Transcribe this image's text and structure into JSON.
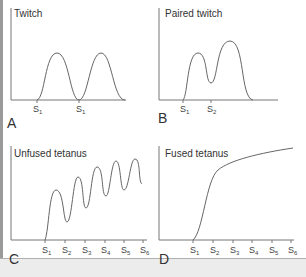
{
  "figure": {
    "panels": [
      {
        "id": "A",
        "title": "Twitch",
        "stimuli": [
          "S1",
          "S1"
        ]
      },
      {
        "id": "B",
        "title": "Paired twitch",
        "stimuli": [
          "S1",
          "S2"
        ]
      },
      {
        "id": "C",
        "title": "Unfused tetanus",
        "stimuli": [
          "S1",
          "S2",
          "S3",
          "S4",
          "S5",
          "S6"
        ]
      },
      {
        "id": "D",
        "title": "Fused tetanus",
        "stimuli": [
          "S1",
          "S2",
          "S3",
          "S4",
          "S5",
          "S6"
        ]
      }
    ]
  }
}
